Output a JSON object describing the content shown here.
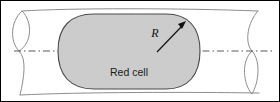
{
  "figure": {
    "labels": {
      "radius": "R",
      "cell": "Red cell"
    },
    "colors": {
      "cell_fill": "#cccccc",
      "cell_stroke": "#4a4a4a",
      "tube_stroke": "#8d8d8d",
      "axis_stroke": "#5a5a5a",
      "annotation": "#111111",
      "background": "#ffffff"
    },
    "geometry": {
      "width": 280,
      "height": 102,
      "tube_top_y": 10,
      "tube_bottom_y": 93,
      "axis_y": 51,
      "cell_left_x": 58,
      "cell_right_x": 200,
      "cell_top_y": 14,
      "cell_bottom_y": 89,
      "cell_corner_radius": 36,
      "radius_arrow_start": [
        157,
        52
      ],
      "radius_arrow_end": [
        186,
        22
      ]
    }
  }
}
